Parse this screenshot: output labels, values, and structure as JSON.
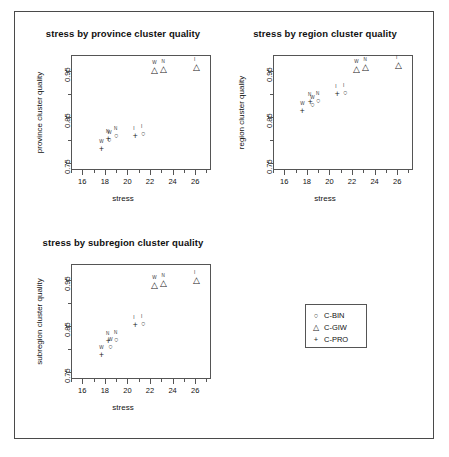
{
  "figure": {
    "xlabel": "stress",
    "x_ticks": [
      "16",
      "18",
      "20",
      "22",
      "24",
      "26"
    ],
    "y_ticks": [
      "0.75",
      "0.85",
      "0.95"
    ]
  },
  "legend": {
    "items": [
      {
        "symbol": "○",
        "symbol_name": "circle-marker",
        "label": "C-BIN"
      },
      {
        "symbol": "△",
        "symbol_name": "triangle-marker",
        "label": "C-GIW"
      },
      {
        "symbol": "+",
        "symbol_name": "plus-marker",
        "label": "C-PRO"
      }
    ]
  },
  "chart_data": [
    {
      "type": "scatter",
      "title": "stress by province cluster quality",
      "xlabel": "stress",
      "ylabel": "province cluster quality",
      "xlim": [
        15.0,
        27.4
      ],
      "ylim": [
        0.735,
        0.985
      ],
      "xticks": [
        16,
        18,
        20,
        22,
        24,
        26
      ],
      "yticks": [
        0.75,
        0.85,
        0.95
      ],
      "grid": false,
      "series": [
        {
          "name": "C-BIN",
          "symbol": "○",
          "points": [
            {
              "x": 18.4,
              "y": 0.798,
              "label": "W"
            },
            {
              "x": 19.0,
              "y": 0.806,
              "label": "N"
            },
            {
              "x": 21.4,
              "y": 0.812,
              "label": "I"
            }
          ]
        },
        {
          "name": "C-GIW",
          "symbol": "△",
          "points": [
            {
              "x": 22.4,
              "y": 0.95,
              "label": "W"
            },
            {
              "x": 23.2,
              "y": 0.953,
              "label": "N"
            },
            {
              "x": 26.1,
              "y": 0.957,
              "label": "I"
            }
          ]
        },
        {
          "name": "C-PRO",
          "symbol": "+",
          "points": [
            {
              "x": 17.7,
              "y": 0.778,
              "label": "W"
            },
            {
              "x": 18.3,
              "y": 0.801,
              "label": "N"
            },
            {
              "x": 20.7,
              "y": 0.807,
              "label": "I"
            }
          ]
        }
      ]
    },
    {
      "type": "scatter",
      "title": "stress by region cluster quality",
      "xlabel": "stress",
      "ylabel": "region cluster quality",
      "xlim": [
        15.0,
        27.4
      ],
      "ylim": [
        0.735,
        0.985
      ],
      "xticks": [
        16,
        18,
        20,
        22,
        24,
        26
      ],
      "yticks": [
        0.75,
        0.85,
        0.95
      ],
      "grid": false,
      "series": [
        {
          "name": "C-BIN",
          "symbol": "○",
          "points": [
            {
              "x": 18.5,
              "y": 0.874,
              "label": "W"
            },
            {
              "x": 19.0,
              "y": 0.882,
              "label": "N"
            },
            {
              "x": 21.4,
              "y": 0.901,
              "label": "I"
            }
          ]
        },
        {
          "name": "C-GIW",
          "symbol": "△",
          "points": [
            {
              "x": 22.4,
              "y": 0.953,
              "label": "W"
            },
            {
              "x": 23.2,
              "y": 0.956,
              "label": "N"
            },
            {
              "x": 26.1,
              "y": 0.962,
              "label": "I"
            }
          ]
        },
        {
          "name": "C-PRO",
          "symbol": "+",
          "points": [
            {
              "x": 17.6,
              "y": 0.862,
              "label": "W"
            },
            {
              "x": 18.3,
              "y": 0.88,
              "label": "N"
            },
            {
              "x": 20.7,
              "y": 0.899,
              "label": "I"
            }
          ]
        }
      ]
    },
    {
      "type": "scatter",
      "title": "stress by subregion cluster quality",
      "xlabel": "stress",
      "ylabel": "subregion cluster quality",
      "xlim": [
        15.0,
        27.4
      ],
      "ylim": [
        0.735,
        0.985
      ],
      "xticks": [
        16,
        18,
        20,
        22,
        24,
        26
      ],
      "yticks": [
        0.75,
        0.85,
        0.95
      ],
      "grid": false,
      "series": [
        {
          "name": "C-BIN",
          "symbol": "○",
          "points": [
            {
              "x": 18.5,
              "y": 0.803,
              "label": "W"
            },
            {
              "x": 19.0,
              "y": 0.818,
              "label": "N"
            },
            {
              "x": 21.4,
              "y": 0.853,
              "label": "I"
            }
          ]
        },
        {
          "name": "C-GIW",
          "symbol": "△",
          "points": [
            {
              "x": 22.4,
              "y": 0.937,
              "label": "W"
            },
            {
              "x": 23.2,
              "y": 0.942,
              "label": "N"
            },
            {
              "x": 26.1,
              "y": 0.948,
              "label": "I"
            }
          ]
        },
        {
          "name": "C-PRO",
          "symbol": "+",
          "points": [
            {
              "x": 17.7,
              "y": 0.786,
              "label": "W"
            },
            {
              "x": 18.3,
              "y": 0.815,
              "label": "N"
            },
            {
              "x": 20.7,
              "y": 0.851,
              "label": "I"
            }
          ]
        }
      ]
    }
  ]
}
